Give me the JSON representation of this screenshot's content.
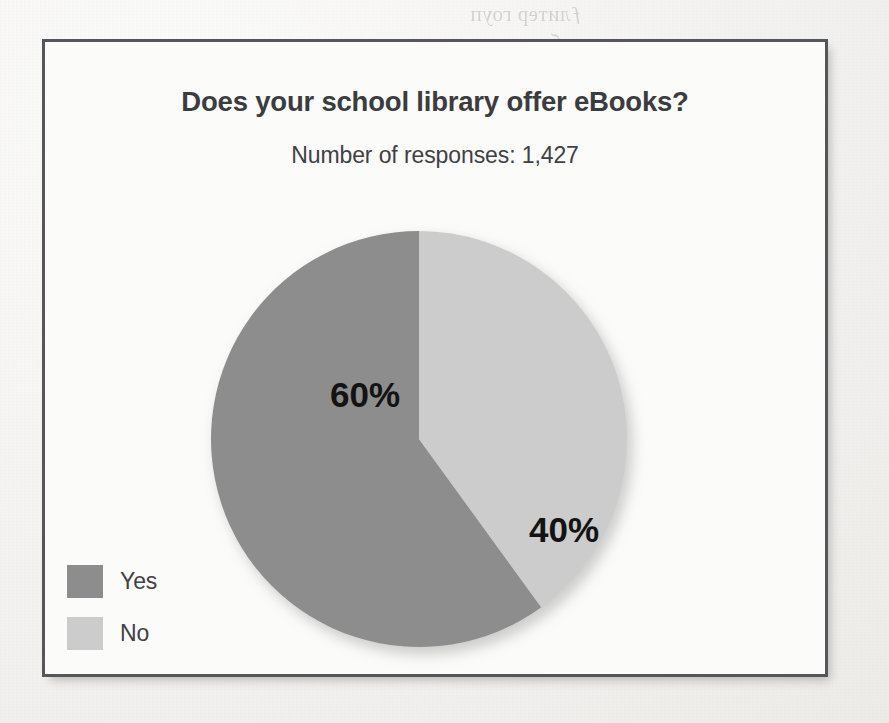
{
  "chart_data": {
    "type": "pie",
    "title": "Does your school library offer eBooks?",
    "subtitle": "Number of responses: 1,427",
    "total_responses": "1,427",
    "categories": [
      "Yes",
      "No"
    ],
    "values": [
      60,
      40
    ],
    "unit": "%",
    "data_labels": [
      "60%",
      "40%"
    ],
    "colors": [
      "#8d8d8d",
      "#cccccc"
    ],
    "start_angle_deg": 0,
    "direction": "clockwise",
    "legend_position": "bottom-left",
    "grid": false,
    "slices": [
      {
        "label": "Yes",
        "value": 60,
        "data_label": "60%",
        "color": "#8d8d8d",
        "start_deg": 144,
        "end_deg": 360,
        "label_x": 154,
        "label_y": 167
      },
      {
        "label": "No",
        "value": 40,
        "data_label": "40%",
        "color": "#cccccc",
        "start_deg": 0,
        "end_deg": 144,
        "label_x": 353,
        "label_y": 302
      }
    ]
  },
  "chart": {
    "title": "Does your school library offer eBooks?",
    "subtitle": "Number of responses: 1,427",
    "labels": {
      "yes_percent": "60%",
      "no_percent": "40%"
    },
    "legend": [
      {
        "label": "Yes",
        "color": "#8d8d8d"
      },
      {
        "label": "No",
        "color": "#cccccc"
      }
    ]
  },
  "page": {
    "background_color": "#f3f2f0",
    "frame_border_color": "#55565a",
    "bleed_through": [
      "ƒлитер гоуп",
      "сольт бест",
      "марн стер",
      "ер нитс",
      "кольте на",
      "рес стел",
      "име топ",
      "сентр ре",
      "ратер"
    ]
  }
}
